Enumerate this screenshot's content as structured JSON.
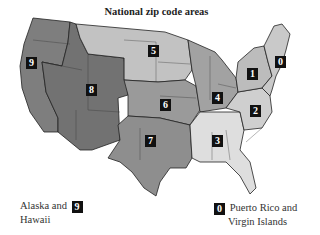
{
  "title": "National zip code areas",
  "colors": {
    "zone0": "#c9c9c9",
    "zone1": "#bcbcbc",
    "zone2": "#cfcfcf",
    "zone3": "#dedede",
    "zone4": "#a2a2a2",
    "zone5": "#c2c2c2",
    "zone6": "#9a9a9a",
    "zone7": "#8e8e8e",
    "zone8": "#727272",
    "zone9": "#7e7e7e",
    "border": "#222222",
    "badge": "#111111"
  },
  "zones": [
    {
      "digit": "0",
      "region": "New England / NJ"
    },
    {
      "digit": "1",
      "region": "NY / PA / DE"
    },
    {
      "digit": "2",
      "region": "Mid-Atlantic / Carolinas"
    },
    {
      "digit": "3",
      "region": "Southeast"
    },
    {
      "digit": "4",
      "region": "Great Lakes"
    },
    {
      "digit": "5",
      "region": "Upper Midwest / Northern Plains"
    },
    {
      "digit": "6",
      "region": "Central Plains"
    },
    {
      "digit": "7",
      "region": "South Central"
    },
    {
      "digit": "8",
      "region": "Mountain"
    },
    {
      "digit": "9",
      "region": "Pacific"
    }
  ],
  "legend": {
    "alaska_hawaii": {
      "line1": "Alaska and",
      "line2": "Hawaii",
      "digit": "9"
    },
    "pr_vi": {
      "line1": "Puerto Rico and",
      "line2": "Virgin Islands",
      "digit": "0"
    }
  }
}
